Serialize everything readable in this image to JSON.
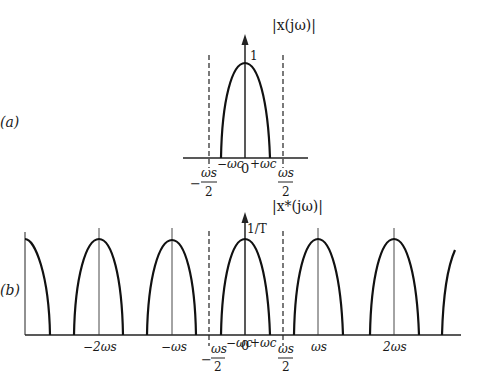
{
  "figure": {
    "panel_a": {
      "label": "(a)",
      "ylabel": "|x(jω)|",
      "peak_label": "1",
      "ticks": {
        "neg_half_ws_sign": "−",
        "neg_half_ws_num": "ωs",
        "neg_half_ws_den": "2",
        "neg_wc": "−ωc",
        "zero": "0",
        "pos_wc": "+ωc",
        "pos_half_ws_num": "ωs",
        "pos_half_ws_den": "2"
      }
    },
    "panel_b": {
      "label": "(b)",
      "ylabel": "|x*(jω)|",
      "peak_label": "1/T",
      "ticks": {
        "neg_2ws": "−2ωs",
        "neg_ws": "−ωs",
        "neg_half_ws_sign": "−",
        "neg_half_ws_num": "ωs",
        "neg_half_ws_den": "2",
        "neg_wc": "−ωc",
        "zero": "0",
        "pos_wc": "+ωc",
        "pos_half_ws_num": "ωs",
        "pos_half_ws_den": "2",
        "pos_ws": "ωs",
        "pos_2ws": "2ωs"
      }
    }
  }
}
